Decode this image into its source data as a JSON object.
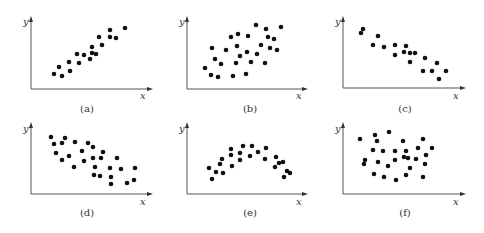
{
  "chart_data": [
    {
      "type": "scatter",
      "id": "a",
      "caption": "(a)",
      "xlabel": "x",
      "ylabel": "y",
      "relationship": "strong positive linear correlation",
      "frame": {
        "ox": 31,
        "oy": 89,
        "xend": 153,
        "ytop": 16,
        "ylab": [
          23,
          25
        ],
        "xlab": [
          140,
          99
        ],
        "cap": [
          87,
          112
        ]
      },
      "points": [
        [
          54,
          74
        ],
        [
          59,
          67
        ],
        [
          62,
          76
        ],
        [
          69,
          62
        ],
        [
          70,
          71
        ],
        [
          77,
          54
        ],
        [
          79,
          63
        ],
        [
          84,
          55
        ],
        [
          90,
          59
        ],
        [
          92,
          47
        ],
        [
          92,
          53
        ],
        [
          96,
          54
        ],
        [
          99,
          37
        ],
        [
          102,
          45
        ],
        [
          110,
          30
        ],
        [
          110,
          37
        ],
        [
          116,
          38
        ],
        [
          125,
          28
        ]
      ]
    },
    {
      "type": "scatter",
      "id": "b",
      "caption": "(b)",
      "xlabel": "x",
      "ylabel": "y",
      "relationship": "weak positive correlation",
      "frame": {
        "ox": 187,
        "oy": 89,
        "xend": 308,
        "ytop": 16,
        "ylab": [
          179,
          25
        ],
        "xlab": [
          296,
          99
        ],
        "cap": [
          250,
          112
        ]
      },
      "points": [
        [
          205,
          68
        ],
        [
          211,
          75
        ],
        [
          212,
          48
        ],
        [
          215,
          59
        ],
        [
          218,
          77
        ],
        [
          221,
          64
        ],
        [
          226,
          50
        ],
        [
          231,
          37
        ],
        [
          233,
          76
        ],
        [
          236,
          63
        ],
        [
          237,
          46
        ],
        [
          238,
          34
        ],
        [
          240,
          56
        ],
        [
          246,
          74
        ],
        [
          247,
          52
        ],
        [
          248,
          36
        ],
        [
          251,
          62
        ],
        [
          256,
          25
        ],
        [
          257,
          54
        ],
        [
          261,
          45
        ],
        [
          265,
          63
        ],
        [
          266,
          29
        ],
        [
          268,
          37
        ],
        [
          270,
          48
        ],
        [
          274,
          39
        ],
        [
          277,
          50
        ],
        [
          281,
          27
        ]
      ]
    },
    {
      "type": "scatter",
      "id": "c",
      "caption": "(c)",
      "xlabel": "x",
      "ylabel": "y",
      "relationship": "strong negative linear correlation",
      "frame": {
        "ox": 343,
        "oy": 88,
        "xend": 466,
        "ytop": 16,
        "ylab": [
          335,
          25
        ],
        "xlab": [
          453,
          99
        ],
        "cap": [
          405,
          112
        ]
      },
      "points": [
        [
          361,
          33
        ],
        [
          363,
          29
        ],
        [
          373,
          45
        ],
        [
          378,
          36
        ],
        [
          384,
          47
        ],
        [
          395,
          45
        ],
        [
          395,
          55
        ],
        [
          404,
          52
        ],
        [
          406,
          46
        ],
        [
          410,
          53
        ],
        [
          410,
          62
        ],
        [
          415,
          53
        ],
        [
          425,
          58
        ],
        [
          423,
          71
        ],
        [
          432,
          71
        ],
        [
          437,
          63
        ],
        [
          439,
          79
        ],
        [
          446,
          71
        ]
      ]
    },
    {
      "type": "scatter",
      "id": "d",
      "caption": "(d)",
      "xlabel": "x",
      "ylabel": "y",
      "relationship": "weak negative correlation",
      "frame": {
        "ox": 31,
        "oy": 194,
        "xend": 153,
        "ytop": 122,
        "ylab": [
          23,
          132
        ],
        "xlab": [
          140,
          205
        ],
        "cap": [
          87,
          216
        ]
      },
      "points": [
        [
          51,
          137
        ],
        [
          54,
          144
        ],
        [
          56,
          153
        ],
        [
          62,
          143
        ],
        [
          62,
          160
        ],
        [
          65,
          138
        ],
        [
          69,
          156
        ],
        [
          74,
          167
        ],
        [
          75,
          142
        ],
        [
          82,
          151
        ],
        [
          84,
          161
        ],
        [
          88,
          143
        ],
        [
          93,
          147
        ],
        [
          93,
          158
        ],
        [
          95,
          167
        ],
        [
          94,
          175
        ],
        [
          100,
          176
        ],
        [
          101,
          158
        ],
        [
          103,
          152
        ],
        [
          110,
          168
        ],
        [
          111,
          177
        ],
        [
          111,
          184
        ],
        [
          117,
          158
        ],
        [
          121,
          169
        ],
        [
          127,
          183
        ],
        [
          134,
          180
        ],
        [
          135,
          168
        ]
      ]
    },
    {
      "type": "scatter",
      "id": "e",
      "caption": "(e)",
      "xlabel": "x",
      "ylabel": "y",
      "relationship": "non-linear (inverted parabola)",
      "frame": {
        "ox": 187,
        "oy": 194,
        "xend": 308,
        "ytop": 122,
        "ylab": [
          179,
          132
        ],
        "xlab": [
          296,
          205
        ],
        "cap": [
          250,
          216
        ]
      },
      "points": [
        [
          209,
          168
        ],
        [
          212,
          179
        ],
        [
          216,
          172
        ],
        [
          220,
          164
        ],
        [
          222,
          159
        ],
        [
          223,
          173
        ],
        [
          231,
          149
        ],
        [
          231,
          155
        ],
        [
          232,
          166
        ],
        [
          240,
          153
        ],
        [
          240,
          160
        ],
        [
          243,
          146
        ],
        [
          250,
          156
        ],
        [
          252,
          146
        ],
        [
          258,
          152
        ],
        [
          265,
          159
        ],
        [
          266,
          148
        ],
        [
          275,
          167
        ],
        [
          276,
          157
        ],
        [
          279,
          163
        ],
        [
          283,
          162
        ],
        [
          284,
          177
        ],
        [
          287,
          171
        ],
        [
          290,
          173
        ]
      ]
    },
    {
      "type": "scatter",
      "id": "f",
      "caption": "(f)",
      "xlabel": "x",
      "ylabel": "y",
      "relationship": "no correlation",
      "frame": {
        "ox": 343,
        "oy": 194,
        "xend": 466,
        "ytop": 122,
        "ylab": [
          335,
          132
        ],
        "xlab": [
          453,
          205
        ],
        "cap": [
          405,
          216
        ]
      },
      "points": [
        [
          360,
          139
        ],
        [
          364,
          164
        ],
        [
          365,
          160
        ],
        [
          373,
          150
        ],
        [
          374,
          174
        ],
        [
          375,
          135
        ],
        [
          377,
          141
        ],
        [
          378,
          162
        ],
        [
          383,
          151
        ],
        [
          384,
          177
        ],
        [
          388,
          166
        ],
        [
          389,
          132
        ],
        [
          395,
          151
        ],
        [
          395,
          160
        ],
        [
          396,
          180
        ],
        [
          403,
          141
        ],
        [
          404,
          157
        ],
        [
          406,
          151
        ],
        [
          406,
          175
        ],
        [
          408,
          158
        ],
        [
          410,
          168
        ],
        [
          416,
          159
        ],
        [
          418,
          148
        ],
        [
          423,
          139
        ],
        [
          423,
          177
        ],
        [
          425,
          164
        ],
        [
          426,
          155
        ],
        [
          432,
          148
        ]
      ]
    }
  ]
}
